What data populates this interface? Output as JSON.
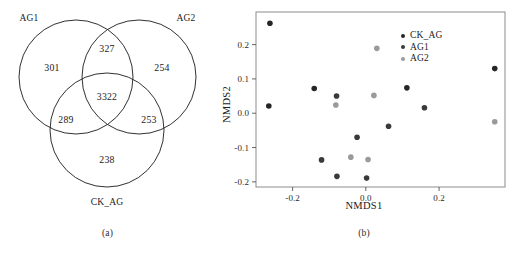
{
  "figure": {
    "panels": [
      {
        "id": "a",
        "caption": "(a)",
        "type": "venn"
      },
      {
        "id": "b",
        "caption": "(b)",
        "type": "scatter"
      }
    ]
  },
  "venn": {
    "type": "venn3",
    "set_labels": [
      {
        "name": "AG1",
        "position": "top-left"
      },
      {
        "name": "AG2",
        "position": "top-right"
      },
      {
        "name": "CK_AG",
        "position": "bottom"
      }
    ],
    "regions": [
      {
        "key": "AG1_only",
        "label": "301",
        "value": 301
      },
      {
        "key": "AG1_AG2",
        "label": "327",
        "value": 327
      },
      {
        "key": "AG2_only",
        "label": "254",
        "value": 254
      },
      {
        "key": "AG1_AG2_CK_AG",
        "label": "3322",
        "value": 3322
      },
      {
        "key": "AG1_CK_AG",
        "label": "289",
        "value": 289
      },
      {
        "key": "AG2_CK_AG",
        "label": "253",
        "value": 253
      },
      {
        "key": "CK_AG_only",
        "label": "238",
        "value": 238
      }
    ],
    "stroke_color": "#1a1a1a"
  },
  "chart_data": {
    "type": "scatter",
    "title": "",
    "xlabel": "NMDS1",
    "ylabel": "NMDS2",
    "xlim": [
      -0.3,
      0.38
    ],
    "ylim": [
      -0.215,
      0.295
    ],
    "xticks": [
      -0.2,
      0.0,
      0.2
    ],
    "xticklabels": [
      "-0.2",
      "0.0",
      "0.2"
    ],
    "yticks": [
      0.2,
      0.1,
      0.0,
      -0.1,
      -0.2
    ],
    "yticklabels": [
      "0.2",
      "0.1",
      "0.0",
      "-0.1",
      "-0.2"
    ],
    "grid": false,
    "legend_position": "top-right",
    "series": [
      {
        "name": "CK_AG",
        "color": "#262626",
        "points": [
          {
            "x": -0.262,
            "y": 0.262
          },
          {
            "x": -0.265,
            "y": 0.021
          },
          {
            "x": -0.141,
            "y": 0.072
          },
          {
            "x": 0.112,
            "y": 0.074
          },
          {
            "x": 0.352,
            "y": 0.13
          }
        ]
      },
      {
        "name": "AG1",
        "color": "#3a3a3a",
        "points": [
          {
            "x": -0.08,
            "y": 0.05
          },
          {
            "x": 0.16,
            "y": 0.016
          },
          {
            "x": 0.062,
            "y": -0.038
          },
          {
            "x": -0.024,
            "y": -0.07
          },
          {
            "x": -0.121,
            "y": -0.136
          },
          {
            "x": -0.079,
            "y": -0.184
          },
          {
            "x": 0.002,
            "y": -0.189
          }
        ]
      },
      {
        "name": "AG2",
        "color": "#9a9a9a",
        "points": [
          {
            "x": 0.03,
            "y": 0.189
          },
          {
            "x": 0.022,
            "y": 0.052
          },
          {
            "x": -0.082,
            "y": 0.024
          },
          {
            "x": 0.352,
            "y": -0.025
          },
          {
            "x": -0.041,
            "y": -0.128
          },
          {
            "x": 0.006,
            "y": -0.135
          }
        ]
      }
    ]
  }
}
